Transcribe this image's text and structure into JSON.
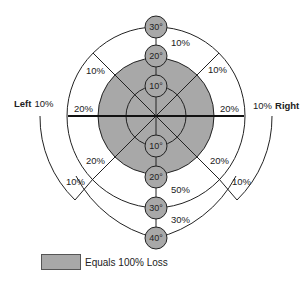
{
  "diagram": {
    "colors": {
      "loss_fill": "#a8a8a8",
      "line": "#222222",
      "background": "#ffffff"
    },
    "sides": {
      "left": "Left",
      "left_value": "10%",
      "right": "Right",
      "right_value": "10%"
    },
    "degree_markers_up": [
      "30°",
      "20°",
      "10°"
    ],
    "degree_markers_down": [
      "10°",
      "20°",
      "30°",
      "40°"
    ],
    "percent_labels": {
      "upper_top": "10%",
      "upper_left_diag": "10%",
      "upper_right_diag": "10%",
      "horiz_left": "20%",
      "horiz_right": "20%",
      "lower_left_inner": "20%",
      "lower_left_outer": "10%",
      "lower_right_inner": "20%",
      "lower_right_outer": "10%",
      "lower_mid": "50%",
      "lower_bottom": "30%"
    }
  },
  "legend": {
    "label": "Equals 100% Loss"
  }
}
